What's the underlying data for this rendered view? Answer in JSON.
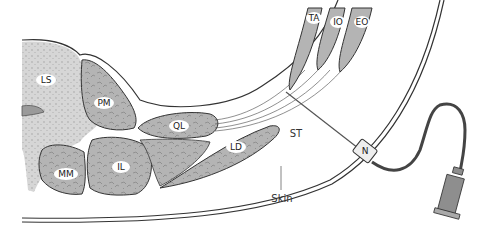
{
  "diagram": {
    "type": "anatomical cross-section",
    "colors": {
      "bone": "#d6d6d6",
      "muscle": "#b4b4b4",
      "outline": "#333333",
      "label_bg": "#ffffff",
      "tube": "#444444",
      "syringe": "#8e8e8e"
    },
    "labels": {
      "ls": "LS",
      "pm": "PM",
      "ql": "QL",
      "mm": "MM",
      "il": "IL",
      "ld": "LD",
      "ta": "TA",
      "io": "IO",
      "eo": "EO",
      "st": "ST",
      "n": "N",
      "skin": "Skin"
    }
  }
}
